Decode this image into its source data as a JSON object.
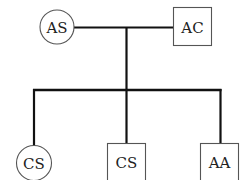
{
  "diagram": {
    "type": "family-tree",
    "colors": {
      "line": "#111111",
      "shape_stroke": "#555555",
      "text": "#222222",
      "background": "#ffffff"
    },
    "parents": [
      {
        "id": "as",
        "label": "AS",
        "shape": "circle"
      },
      {
        "id": "ac",
        "label": "AC",
        "shape": "square"
      }
    ],
    "children": [
      {
        "id": "cs1",
        "label": "CS",
        "shape": "circle"
      },
      {
        "id": "cs2",
        "label": "CS",
        "shape": "square"
      },
      {
        "id": "aa",
        "label": "AA",
        "shape": "square"
      }
    ]
  }
}
